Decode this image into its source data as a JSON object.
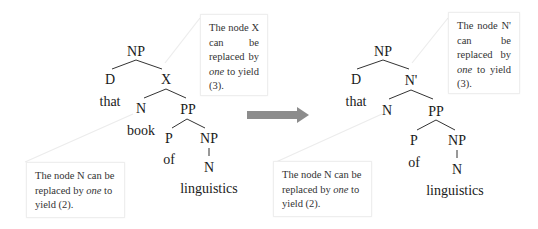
{
  "diagram": {
    "type": "syntax-tree-transformation",
    "arrow_color": "#8c8c8c",
    "left_tree": {
      "root": "NP",
      "nodes": {
        "np": "NP",
        "d": "D",
        "x": "X",
        "n": "N",
        "pp": "PP",
        "p": "P",
        "np2": "NP",
        "n2": "N"
      },
      "words": {
        "that": "that",
        "book": "book",
        "of": "of",
        "linguistics": "linguistics"
      },
      "callout_top": {
        "pre": "The node X can be replaced by ",
        "em": "one",
        "post": " to yield (3)."
      },
      "callout_bottom": {
        "pre": "The node N can be replaced by ",
        "em": "one",
        "post": " to yield (2)."
      }
    },
    "right_tree": {
      "root": "NP",
      "nodes": {
        "np": "NP",
        "d": "D",
        "nbar": "N'",
        "n": "N",
        "pp": "PP",
        "p": "P",
        "np2": "NP",
        "n2": "N"
      },
      "words": {
        "that": "that",
        "of": "of",
        "linguistics": "linguistics"
      },
      "callout_top": {
        "pre": "The node N' can be replaced by ",
        "em": "one",
        "post": " to yield (3)."
      },
      "callout_bottom": {
        "pre": "The node N can be replaced by ",
        "em": "one",
        "post": " to yield (2)."
      }
    }
  }
}
